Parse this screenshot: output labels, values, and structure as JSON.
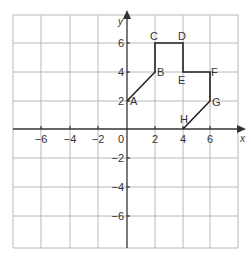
{
  "diagram": {
    "axes": {
      "x_label": "x",
      "y_label": "y",
      "x_ticks": [
        {
          "value": -6,
          "label": "−6"
        },
        {
          "value": -4,
          "label": "−4"
        },
        {
          "value": -2,
          "label": "−2"
        },
        {
          "value": 2,
          "label": "2"
        },
        {
          "value": 4,
          "label": "4"
        },
        {
          "value": 6,
          "label": "6"
        }
      ],
      "y_ticks": [
        {
          "value": 6,
          "label": "6"
        },
        {
          "value": 4,
          "label": "4"
        },
        {
          "value": 2,
          "label": "2"
        },
        {
          "value": -2,
          "label": "−2"
        },
        {
          "value": -4,
          "label": "−4"
        },
        {
          "value": -6,
          "label": "−6"
        }
      ],
      "origin_label": "0",
      "range": {
        "x": [
          -8,
          8
        ],
        "y": [
          -8,
          8
        ]
      },
      "grid_step": 2
    },
    "points": [
      {
        "label": "A",
        "x": 0,
        "y": 2
      },
      {
        "label": "B",
        "x": 2,
        "y": 4
      },
      {
        "label": "C",
        "x": 2,
        "y": 6
      },
      {
        "label": "D",
        "x": 4,
        "y": 6
      },
      {
        "label": "E",
        "x": 4,
        "y": 4
      },
      {
        "label": "F",
        "x": 6,
        "y": 4
      },
      {
        "label": "G",
        "x": 6,
        "y": 2
      },
      {
        "label": "H",
        "x": 4,
        "y": 0
      }
    ],
    "colors": {
      "grid": "#b8b8b8",
      "axis": "#333333",
      "shape": "#222222",
      "text": "#333333"
    }
  }
}
